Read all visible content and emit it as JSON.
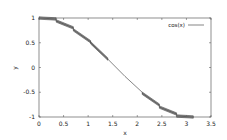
{
  "chart_data": {
    "type": "line",
    "title": "",
    "xlabel": "x",
    "ylabel": "y",
    "xlim": [
      0,
      3.5
    ],
    "ylim": [
      -1,
      1
    ],
    "grid": false,
    "legend_position": "top-right",
    "xticks": [
      "0",
      "0.5",
      "1",
      "1.5",
      "2",
      "2.5",
      "3",
      "3.5"
    ],
    "yticks": [
      "-1",
      "-0.5",
      "0",
      "0.5",
      "1"
    ],
    "series": [
      {
        "name": "cos(x)",
        "color": "#333333",
        "style": "stepped band segments with thin center line",
        "x": [
          0,
          0.35,
          0.35,
          0.7,
          0.7,
          1.05,
          1.05,
          1.4,
          1.75,
          2.1,
          2.1,
          2.45,
          2.45,
          2.8,
          2.8,
          3.14
        ],
        "y": [
          1.0,
          0.98,
          0.94,
          0.8,
          0.76,
          0.52,
          0.5,
          0.17,
          -0.18,
          -0.5,
          -0.52,
          -0.76,
          -0.8,
          -0.94,
          -0.98,
          -1.0
        ]
      }
    ]
  },
  "legend": {
    "label": "cos(x)"
  },
  "axes": {
    "xlabel": "x",
    "ylabel": "y",
    "xticks": [
      "0",
      "0.5",
      "1",
      "1.5",
      "2",
      "2.5",
      "3",
      "3.5"
    ],
    "yticks": [
      "-1",
      "-0.5",
      "0",
      "0.5",
      "1"
    ]
  }
}
